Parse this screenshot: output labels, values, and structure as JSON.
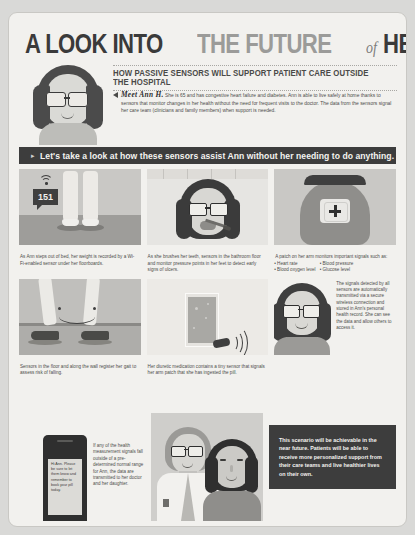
{
  "title": {
    "part1": "A LOOK INTO",
    "part2": "THE FUTURE",
    "connector": "of",
    "part3": "HEALTH CARE"
  },
  "subtitle": "HOW PASSIVE SENSORS WILL SUPPORT PATIENT CARE OUTSIDE THE HOSPITAL",
  "intro": {
    "lead": "Meet Ann H.",
    "body": " She is 65 and has congestive heart failure and diabetes. Ann is able to live safely at home thanks to sensors that monitor changes in her health without the need for frequent visits to the doctor. The data from the sensors signal her care team (clinicians and family members) when support is needed."
  },
  "banner": "Let's take a look at how these sensors assist Ann without her needing to do anything.",
  "panels": [
    {
      "id": "weight-scale",
      "value": "151",
      "caption": "As Ann steps out of bed, her weight is recorded by a Wi-Fi-enabled sensor under her floorboards."
    },
    {
      "id": "teeth-brushing",
      "caption": "As she brushes her teeth, sensors in the bathroom floor and monitor pressure points in her feet to detect early signs of ulcers."
    },
    {
      "id": "arm-patch",
      "caption": "A patch on her arm monitors important signals such as:",
      "bullets_left": [
        "Heart rate",
        "Blood oxygen level"
      ],
      "bullets_right": [
        "Blood pressure",
        "Glucose level"
      ]
    },
    {
      "id": "floor-gait",
      "caption": "Sensors in the floor and along the wall register her gait to assess risk of falling."
    },
    {
      "id": "smart-pill",
      "caption": "Her diuretic medication contains a tiny sensor that signals her arm patch that she has ingested the pill."
    },
    {
      "id": "health-record",
      "text": "The signals detected by all sensors are automatically transmitted via a secure wireless connection and stored in Ann's personal health record. She can see the data and allow others to access it."
    }
  ],
  "bottom": {
    "phone_screen": "Hi Ann. Please be sure to let them know and remember to book your pill today.",
    "phone_caption": "If any of the health measurement signals fall outside of a pre-determined normal range for Ann, the data are transmitted to her doctor and her daughter.",
    "conclusion": "This scenario will be achievable in the near future. Patients will be able to receive more personalized support from their care teams and live healthier lives on their own."
  },
  "colors": {
    "page_bg": "#f2f1ee",
    "ink_dark": "#3d3d3d",
    "ink_gray": "#9b9b99",
    "body_text": "#4d4d4b"
  }
}
